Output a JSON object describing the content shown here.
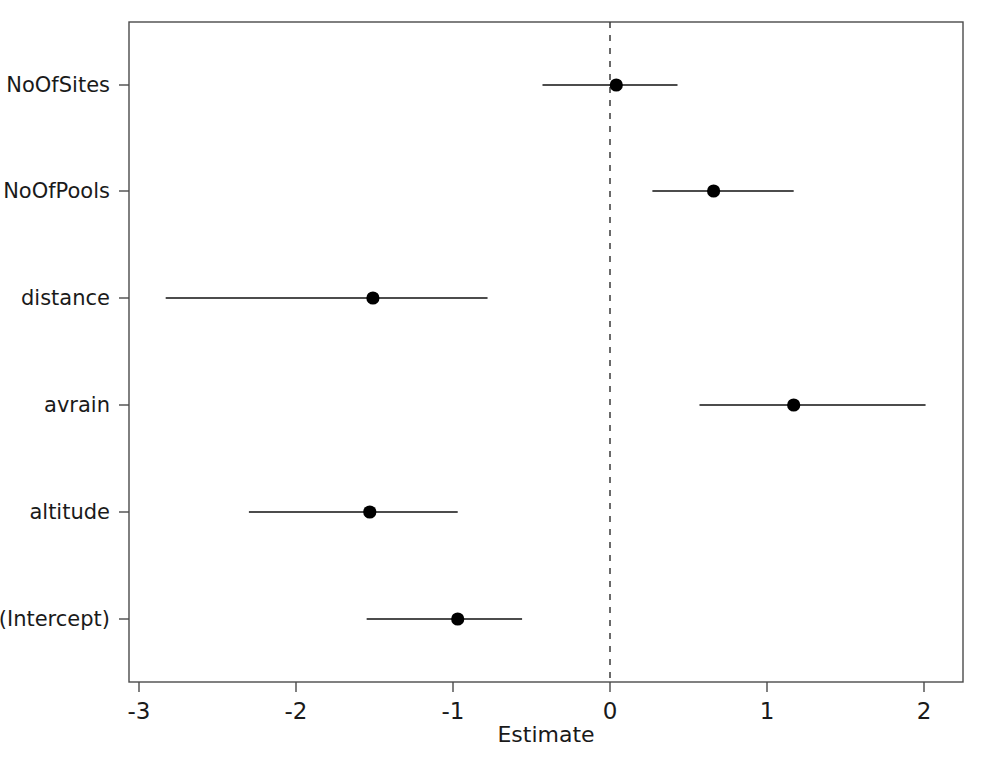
{
  "chart_data": {
    "type": "scatter",
    "plot_kind": "forest-plot",
    "title": "",
    "subtitle": "",
    "xlabel": "Estimate",
    "ylabel": "",
    "xlim": [
      -3.35,
      2.25
    ],
    "xticks": [
      -3,
      -2,
      -1,
      0,
      1,
      2
    ],
    "xticklabels": [
      "-3",
      "-2",
      "-1",
      "0",
      "1",
      "2"
    ],
    "grid": false,
    "legend": "none",
    "reference_line": {
      "orientation": "vertical",
      "value": 0,
      "style": "dashed",
      "color": "#3a3a3a"
    },
    "categories": [
      "(Intercept)",
      "altitude",
      "avrain",
      "distance",
      "NoOfPools",
      "NoOfSites"
    ],
    "category_order_top_to_bottom": [
      "NoOfSites",
      "NoOfPools",
      "distance",
      "avrain",
      "altitude",
      "(Intercept)"
    ],
    "series": [
      {
        "name": "Estimate with 95% CI",
        "marker": "filled-circle",
        "color": "#000000",
        "points": [
          {
            "term": "NoOfSites",
            "estimate": 0.04,
            "ci_low": -0.43,
            "ci_high": 0.43
          },
          {
            "term": "NoOfPools",
            "estimate": 0.66,
            "ci_low": 0.27,
            "ci_high": 1.17
          },
          {
            "term": "distance",
            "estimate": -1.51,
            "ci_low": -2.83,
            "ci_high": -0.78
          },
          {
            "term": "avrain",
            "estimate": 1.17,
            "ci_low": 0.57,
            "ci_high": 2.01
          },
          {
            "term": "altitude",
            "estimate": -1.53,
            "ci_low": -2.3,
            "ci_high": -0.97
          },
          {
            "term": "(Intercept)",
            "estimate": -0.97,
            "ci_low": -1.55,
            "ci_high": -0.56
          }
        ]
      }
    ]
  },
  "axes": {
    "x_title": "Estimate",
    "x_tick_labels": [
      "-3",
      "-2",
      "-1",
      "0",
      "1",
      "2"
    ],
    "y_tick_labels": [
      "NoOfSites",
      "NoOfPools",
      "distance",
      "avrain",
      "altitude",
      "(Intercept)"
    ]
  },
  "colors": {
    "frame": "#4a4a4a",
    "marker": "#000000",
    "interval": "#111111",
    "reference": "#3a3a3a",
    "background": "#ffffff"
  }
}
